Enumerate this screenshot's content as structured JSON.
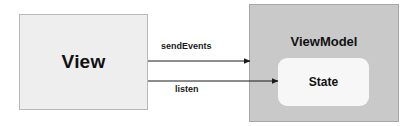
{
  "diagram": {
    "canvas": {
      "width": 414,
      "height": 126,
      "background": "#ffffff"
    },
    "nodes": {
      "view": {
        "label": "View",
        "fill": "#eeeeee",
        "border": "#b9b9b9"
      },
      "viewmodel": {
        "label": "ViewModel",
        "fill": "#c9c9c9",
        "border": "#a8a8a8"
      },
      "state": {
        "label": "State",
        "fill": "#f7f7f7"
      }
    },
    "edges": [
      {
        "id": "send-events",
        "label": "sendEvents",
        "from": "view",
        "to": "viewmodel",
        "direction": "right",
        "color": "#1a1a1a"
      },
      {
        "id": "listen",
        "label": "listen",
        "from": "view",
        "to": "state",
        "direction": "right",
        "color": "#1a1a1a"
      }
    ]
  }
}
